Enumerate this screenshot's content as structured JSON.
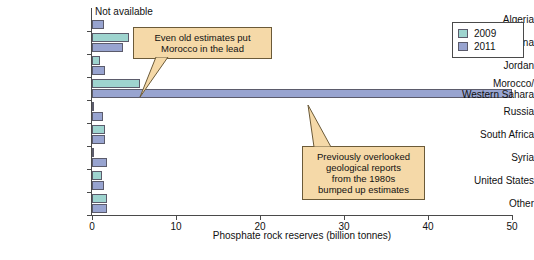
{
  "chart_data": {
    "type": "bar",
    "orientation": "horizontal",
    "title": "",
    "xlabel": "Phosphate rock reserves (billion tonnes)",
    "ylabel": "",
    "xlim": [
      0,
      50
    ],
    "xticks": [
      0,
      10,
      20,
      30,
      40,
      50
    ],
    "grid": false,
    "legend_position": "top-right",
    "categories": [
      "Algeria",
      "China",
      "Jordan",
      "Morocco/\nWestern Sahara",
      "Russia",
      "South Africa",
      "Syria",
      "United States",
      "Other"
    ],
    "series": [
      {
        "name": "2009",
        "color": "#9ed4cf",
        "values": [
          null,
          4.4,
          0.9,
          5.7,
          0.2,
          1.5,
          0.1,
          1.2,
          1.8
        ]
      },
      {
        "name": "2011",
        "color": "#98a4d0",
        "values": [
          1.4,
          3.7,
          1.5,
          50.0,
          1.3,
          1.5,
          1.8,
          1.4,
          1.8
        ]
      }
    ],
    "annotations": [
      {
        "id": "callout-1",
        "text": "Even old estimates put\nMorocco in the lead",
        "points_to": "Morocco/Western Sahara 2009 bar"
      },
      {
        "id": "callout-2",
        "text": "Previously overlooked\ngeological reports\nfrom the 1980s\nbumped up estimates",
        "points_to": "Morocco/Western Sahara 2011 bar"
      }
    ],
    "notes": [
      {
        "id": "not-available",
        "text": "Not available",
        "applies_to": "Algeria 2009"
      }
    ]
  },
  "legend": {
    "entries": [
      {
        "label": "2009",
        "color": "#9ed4cf"
      },
      {
        "label": "2011",
        "color": "#98a4d0"
      }
    ]
  },
  "axis": {
    "x_title": "Phosphate rock reserves (billion tonnes)",
    "tick_labels": [
      "0",
      "10",
      "20",
      "30",
      "40",
      "50"
    ]
  }
}
